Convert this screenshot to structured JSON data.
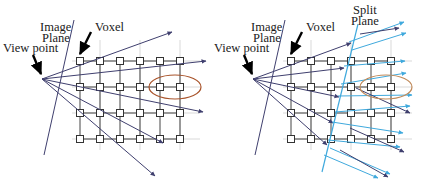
{
  "figure": {
    "panels": [
      {
        "id": "left",
        "name": "perspective-ray-casting-panel",
        "labels": {
          "image_plane_line1": "Image",
          "image_plane_line2": "Plane",
          "view_point": "View point",
          "voxel": "Voxel"
        },
        "grid": {
          "columns": 6,
          "rows": 4,
          "node_shape": "square",
          "origin_x": 80,
          "origin_y": 61,
          "col_spacing": 20,
          "row_spacing": 26
        },
        "viewpoint": {
          "x": 42,
          "y": 79
        },
        "ray_count": 5,
        "ray_color": "#3f3f6e",
        "highlight_ellipse": {
          "cx": 175,
          "cy": 87,
          "rx": 26,
          "ry": 12,
          "color": "#a8532a"
        }
      },
      {
        "id": "right",
        "name": "split-plane-ray-casting-panel",
        "labels": {
          "image_plane_line1": "Image",
          "image_plane_line2": "Plane",
          "view_point": "View point",
          "voxel": "Voxel",
          "split_plane_line1": "Split",
          "split_plane_line2": "Plane"
        },
        "grid": {
          "columns": 6,
          "rows": 4,
          "node_shape": "square",
          "origin_x": 291,
          "origin_y": 61,
          "col_spacing": 20,
          "row_spacing": 26
        },
        "viewpoint": {
          "x": 253,
          "y": 79
        },
        "ray_count": 5,
        "ray_color": "#3f3f6e",
        "parallel_ray_color": "#3fa9dd",
        "split_plane_color": "#3fa9dd",
        "highlight_ellipse": {
          "cx": 386,
          "cy": 87,
          "rx": 26,
          "ry": 12,
          "color": "#c08a5a"
        }
      }
    ],
    "colors": {
      "grid_line": "#444444",
      "grid_line_light": "#9b9b9b",
      "ray": "#3f3f6e",
      "parallel_ray": "#3fa9dd",
      "split_plane": "#3fa9dd",
      "ellipse_left": "#a8532a",
      "ellipse_right": "#c08a5a",
      "text": "#1a1a1a",
      "pointer_arrow": "#000000",
      "background": "#ffffff"
    }
  }
}
